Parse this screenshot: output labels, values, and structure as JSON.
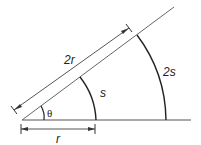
{
  "diagram": {
    "labels": {
      "double_radius": "2r",
      "radius": "r",
      "arc_small": "s",
      "arc_large": "2s",
      "angle": "θ"
    },
    "colors": {
      "line": "#555555",
      "arc": "#222222",
      "text": "#222222"
    }
  }
}
